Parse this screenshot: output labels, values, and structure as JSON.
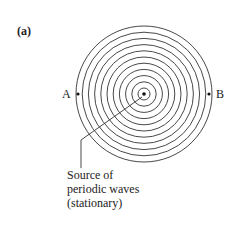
{
  "panel_label": "(a)",
  "point_labels": {
    "left": "A",
    "right": "B"
  },
  "caption": {
    "line1": "Source of",
    "line2": "periodic waves",
    "line3": "(stationary)"
  },
  "diagram": {
    "center": [
      144,
      94
    ],
    "ring_count": 11,
    "outer_radius": 68,
    "stroke_color": "#333333"
  }
}
